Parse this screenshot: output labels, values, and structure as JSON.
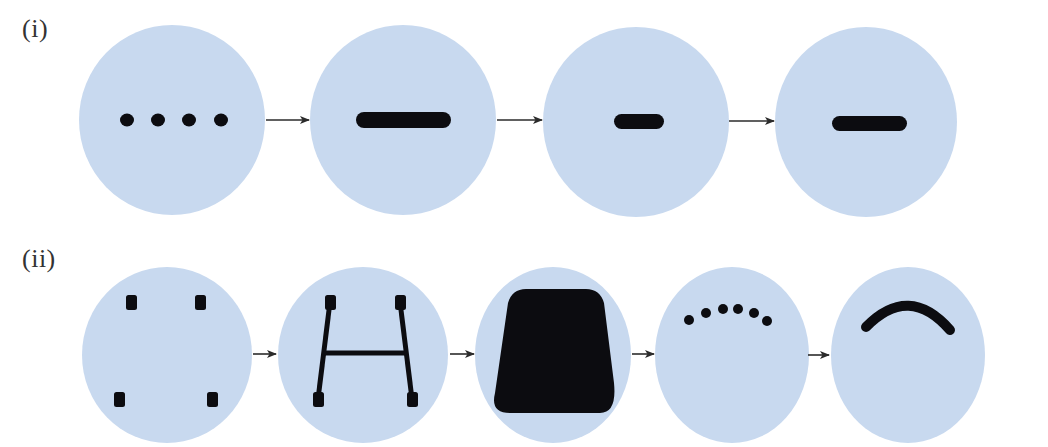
{
  "figure": {
    "colors": {
      "circle_fill": "#c8d9ef",
      "shape_fill": "#0c0c10",
      "arrow": "#2b2b2b",
      "label": "#333333"
    },
    "rows": [
      {
        "label": "(i)",
        "stages": [
          {
            "shape": "four-dots-horizontal"
          },
          {
            "shape": "long-bar"
          },
          {
            "shape": "short-bar"
          },
          {
            "shape": "medium-bar"
          }
        ]
      },
      {
        "label": "(ii)",
        "stages": [
          {
            "shape": "four-square-dots"
          },
          {
            "shape": "h-frame"
          },
          {
            "shape": "filled-trapezoid"
          },
          {
            "shape": "six-dots-arc"
          },
          {
            "shape": "thick-arc"
          }
        ]
      }
    ]
  }
}
